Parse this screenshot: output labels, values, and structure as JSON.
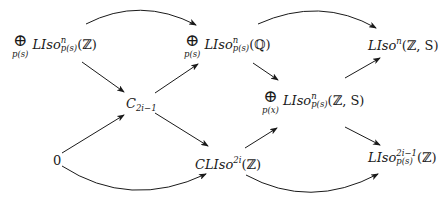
{
  "diagram": {
    "type": "commutative-diagram",
    "background": "#ffffff",
    "stroke_color": "#1a1a1a",
    "nodes": {
      "n1": {
        "oplus": "⊕",
        "oplus_sub": "p(s)",
        "name": "LIso",
        "sup": "n",
        "sub": "p(s)",
        "arg": "(ℤ)"
      },
      "n2": {
        "oplus": "⊕",
        "oplus_sub": "p(s)",
        "name": "LIso",
        "sup": "n",
        "sub": "p(s)",
        "arg": "(ℚ)"
      },
      "n3": {
        "name": "LIso",
        "sup": "n",
        "arg": "(ℤ, S)"
      },
      "n4": {
        "base": "C",
        "sub": "2i−1"
      },
      "n5": {
        "oplus": "⊕",
        "oplus_sub": "p(x)",
        "name": "LIso",
        "sup": "n",
        "sub": "p(s)",
        "arg": "(ℤ, S)"
      },
      "n6": {
        "label": "0"
      },
      "n7": {
        "prefix": "C",
        "name": "LIso",
        "sup": "2i",
        "arg": "(ℤ)"
      },
      "n8": {
        "name": "LIso",
        "sup": "2i−1",
        "sub": "p(s)",
        "arg": "(ℤ)"
      }
    },
    "edges": [
      {
        "from": "n1",
        "to": "n2",
        "style": "curved-up"
      },
      {
        "from": "n2",
        "to": "n3",
        "style": "curved-up"
      },
      {
        "from": "n1",
        "to": "n4",
        "style": "straight"
      },
      {
        "from": "n4",
        "to": "n2",
        "style": "straight"
      },
      {
        "from": "n4",
        "to": "n7",
        "style": "straight"
      },
      {
        "from": "n2",
        "to": "n5",
        "style": "straight"
      },
      {
        "from": "n5",
        "to": "n3",
        "style": "straight"
      },
      {
        "from": "n6",
        "to": "n4",
        "style": "straight"
      },
      {
        "from": "n6",
        "to": "n7",
        "style": "curved-down"
      },
      {
        "from": "n7",
        "to": "n5",
        "style": "straight"
      },
      {
        "from": "n7",
        "to": "n8",
        "style": "curved-down"
      },
      {
        "from": "n5",
        "to": "n8",
        "style": "straight"
      }
    ]
  }
}
